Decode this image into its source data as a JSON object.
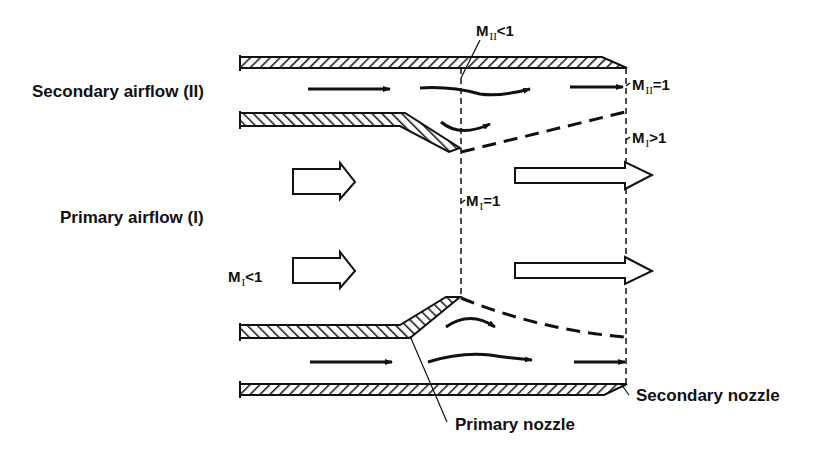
{
  "diagram": {
    "labels": {
      "secondary_airflow": "Secondary airflow (II)",
      "primary_airflow": "Primary airflow (I)",
      "primary_nozzle": "Primary nozzle",
      "secondary_nozzle": "Secondary nozzle"
    },
    "mach_labels": {
      "m2_lt_1": {
        "base": "M",
        "sub": "II",
        "rel": "<1"
      },
      "m2_eq_1": {
        "base": "M",
        "sub": "II",
        "rel": "=1"
      },
      "m1_gt_1": {
        "base": "M",
        "sub": "I",
        "rel": ">1"
      },
      "m1_eq_1": {
        "base": "M",
        "sub": "I",
        "rel": "=1"
      },
      "m1_lt_1": {
        "base": "M",
        "sub": "I",
        "rel": "<1"
      }
    },
    "colors": {
      "line": "#111111",
      "background": "#ffffff"
    }
  }
}
